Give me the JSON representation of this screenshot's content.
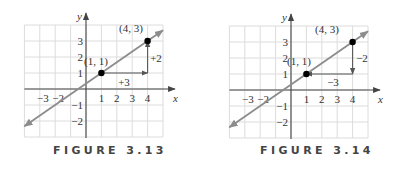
{
  "colors": {
    "grid": "#dcdcdc",
    "axis": "#444444",
    "line": "#8c8c8c",
    "arrow": "#555555",
    "point": "#000000",
    "text": "#333333"
  },
  "figures": [
    {
      "caption": "FIGURE 3.13",
      "offset_x": 0,
      "origin": [
        86,
        89
      ],
      "unit": [
        15.4,
        16
      ],
      "x_axis_label": "x",
      "y_axis_label": "y",
      "x_tick_labels": [
        {
          "value": -3,
          "label": "−3"
        },
        {
          "value": -2,
          "label": "−2"
        },
        {
          "value": 1,
          "label": "1"
        },
        {
          "value": 2,
          "label": "2"
        },
        {
          "value": 3,
          "label": "3"
        },
        {
          "value": 4,
          "label": "4"
        }
      ],
      "y_tick_labels": [
        {
          "value": 3,
          "label": "3"
        },
        {
          "value": 2,
          "label": "2"
        },
        {
          "value": 1,
          "label": "1"
        },
        {
          "value": -1,
          "label": "−1"
        },
        {
          "value": -2,
          "label": "−2"
        }
      ],
      "points": [
        {
          "x": 1,
          "y": 1,
          "label": "(1, 1)",
          "label_pos": [
            96,
            65
          ]
        },
        {
          "x": 4,
          "y": 3,
          "label": "(4, 3)",
          "label_pos": [
            131,
            32
          ]
        }
      ],
      "arrows": [
        {
          "from": [
            1,
            1
          ],
          "to": [
            4,
            1
          ],
          "label": "+3",
          "label_pos": [
            124,
            86
          ]
        },
        {
          "from": [
            4,
            1
          ],
          "to": [
            4,
            3
          ],
          "label": "+2",
          "label_pos": [
            156,
            62
          ]
        }
      ]
    },
    {
      "caption": "FIGURE 3.14",
      "offset_x": 205,
      "origin": [
        86,
        90
      ],
      "unit": [
        15.4,
        16
      ],
      "x_axis_label": "x",
      "y_axis_label": "y",
      "x_tick_labels": [
        {
          "value": -3,
          "label": "−3"
        },
        {
          "value": -2,
          "label": "−2"
        },
        {
          "value": 1,
          "label": "1"
        },
        {
          "value": 2,
          "label": "2"
        },
        {
          "value": 3,
          "label": "3"
        },
        {
          "value": 4,
          "label": "4"
        }
      ],
      "y_tick_labels": [
        {
          "value": 3,
          "label": "3"
        },
        {
          "value": 2,
          "label": "2"
        },
        {
          "value": 1,
          "label": "1"
        },
        {
          "value": -1,
          "label": "−1"
        },
        {
          "value": -2,
          "label": "−2"
        }
      ],
      "points": [
        {
          "x": 1,
          "y": 1,
          "label": "(1, 1)",
          "label_pos": [
            94,
            65
          ]
        },
        {
          "x": 4,
          "y": 3,
          "label": "(4, 3)",
          "label_pos": [
            122,
            33
          ]
        }
      ],
      "arrows": [
        {
          "from": [
            4,
            3
          ],
          "to": [
            4,
            1
          ],
          "label": "−2",
          "label_pos": [
            157,
            62
          ]
        },
        {
          "from": [
            4,
            1
          ],
          "to": [
            1,
            1
          ],
          "label": "−3",
          "label_pos": [
            128,
            86
          ]
        }
      ]
    }
  ],
  "chart_data": [
    {
      "type": "line",
      "title": "FIGURE 3.13",
      "xlabel": "x",
      "ylabel": "y",
      "xlim": [
        -4,
        5
      ],
      "ylim": [
        -3,
        4
      ],
      "grid": true,
      "line": {
        "slope": 0.6667,
        "intercept": 0.3333,
        "x": [
          -4,
          5
        ],
        "y": [
          -2.33,
          3.67
        ]
      },
      "points": [
        {
          "x": 1,
          "y": 1,
          "label": "(1, 1)"
        },
        {
          "x": 4,
          "y": 3,
          "label": "(4, 3)"
        }
      ],
      "annotations": [
        {
          "type": "arrow",
          "from": [
            1,
            1
          ],
          "to": [
            4,
            1
          ],
          "text": "+3"
        },
        {
          "type": "arrow",
          "from": [
            4,
            1
          ],
          "to": [
            4,
            3
          ],
          "text": "+2"
        }
      ]
    },
    {
      "type": "line",
      "title": "FIGURE 3.14",
      "xlabel": "x",
      "ylabel": "y",
      "xlim": [
        -4,
        5
      ],
      "ylim": [
        -3,
        4
      ],
      "grid": true,
      "line": {
        "slope": 0.6667,
        "intercept": 0.3333,
        "x": [
          -4,
          5
        ],
        "y": [
          -2.33,
          3.67
        ]
      },
      "points": [
        {
          "x": 4,
          "y": 3,
          "label": "(4, 3)"
        },
        {
          "x": 1,
          "y": 1,
          "label": "(1, 1)"
        }
      ],
      "annotations": [
        {
          "type": "arrow",
          "from": [
            4,
            3
          ],
          "to": [
            4,
            1
          ],
          "text": "−2"
        },
        {
          "type": "arrow",
          "from": [
            4,
            1
          ],
          "to": [
            1,
            1
          ],
          "text": "−3"
        }
      ]
    }
  ]
}
